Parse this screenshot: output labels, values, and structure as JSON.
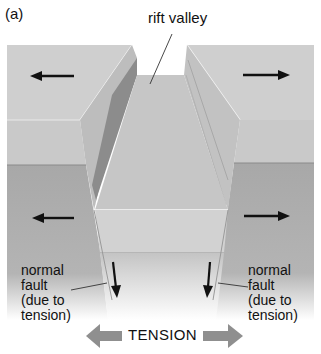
{
  "figure": {
    "panel_label": "(a)",
    "labels": {
      "rift_valley": "rift valley",
      "fault_left": "normal\nfault\n(due to\ntension)",
      "fault_right": "normal\nfault\n(due to\ntension)",
      "tension": "TENSION"
    },
    "arrows": {
      "upper_left": "left",
      "upper_right": "right",
      "lower_left": "left",
      "lower_right": "right",
      "fault_left_motion": "down",
      "fault_right_motion": "down",
      "tension_left": "left",
      "tension_right": "right"
    },
    "colors": {
      "top_face": "#cfcfcf",
      "upper_front": "#c8c8c8",
      "lower_front": "#a9a9a9",
      "wall_dark": "#8c8c8c",
      "wall_light": "#bdbdbd",
      "valley_floor": "#c6c6c6",
      "valley_front": "#d2d2d2",
      "tension_arrow": "#8f8f8f",
      "arrow": "#111111"
    }
  }
}
